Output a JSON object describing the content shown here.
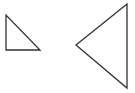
{
  "canvas": {
    "width": 135,
    "height": 93,
    "background": "#ffffff"
  },
  "stroke": {
    "color": "#333333",
    "width": 1.3
  },
  "shapes": [
    {
      "name": "small-right-triangle",
      "points": "6,15 6,50 40,50"
    },
    {
      "name": "large-left-pointing-triangle",
      "points": "127,4 76,45 127,88"
    }
  ]
}
